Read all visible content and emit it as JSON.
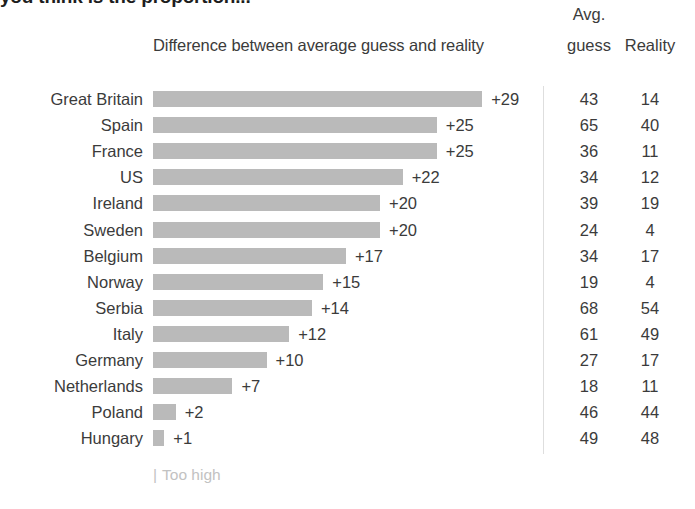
{
  "title_sliver": "you think is the proportion...",
  "header": {
    "difference": "Difference between average guess and reality",
    "avg": "Avg.",
    "guess": "guess",
    "reality": "Reality"
  },
  "legend": {
    "tick": "|",
    "label": "Too high"
  },
  "chart_data": {
    "type": "bar",
    "title": "Difference between average guess and reality",
    "xlabel": "",
    "ylabel": "",
    "orientation": "horizontal",
    "grid": false,
    "legend_position": "bottom-left",
    "legend_entries": [
      "Too high"
    ],
    "xlim": [
      0,
      29
    ],
    "bar_color": "#bababa",
    "categories": [
      "Great Britain",
      "Spain",
      "France",
      "US",
      "Ireland",
      "Sweden",
      "Belgium",
      "Norway",
      "Serbia",
      "Italy",
      "Germany",
      "Netherlands",
      "Poland",
      "Hungary"
    ],
    "values": [
      29,
      25,
      25,
      22,
      20,
      20,
      17,
      15,
      14,
      12,
      10,
      7,
      2,
      1
    ],
    "value_labels": [
      "+29",
      "+25",
      "+25",
      "+22",
      "+20",
      "+20",
      "+17",
      "+15",
      "+14",
      "+12",
      "+10",
      "+7",
      "+2",
      "+1"
    ],
    "columns": [
      "Avg. guess",
      "Reality"
    ],
    "avg_guess": [
      43,
      65,
      36,
      34,
      39,
      24,
      34,
      19,
      68,
      61,
      27,
      18,
      46,
      49
    ],
    "reality": [
      14,
      40,
      11,
      12,
      19,
      4,
      17,
      4,
      54,
      49,
      17,
      11,
      44,
      48
    ]
  }
}
